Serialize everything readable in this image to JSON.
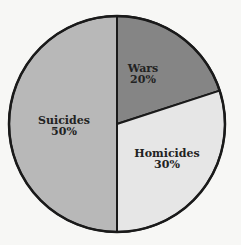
{
  "chart_data": {
    "type": "pie",
    "title": "",
    "categories": [
      "Wars",
      "Homicides",
      "Suicides"
    ],
    "values": [
      20,
      30,
      50
    ],
    "labels": [
      "Wars\n20%",
      "Homicides\n30%",
      "Suicides\n50%"
    ],
    "colors": [
      "#858585",
      "#e6e6e6",
      "#b8b8b8"
    ],
    "start_angle_deg_from_top": 0,
    "direction": "clockwise",
    "legend": "none",
    "edge_color": "#1a1a1a"
  },
  "slices": [
    {
      "name": "Wars",
      "percent": "20%",
      "value": 20,
      "color": "#858585",
      "label_pos": [
        143,
        74
      ]
    },
    {
      "name": "Homicides",
      "percent": "30%",
      "value": 30,
      "color": "#e6e6e6",
      "label_pos": [
        167,
        159
      ]
    },
    {
      "name": "Suicides",
      "percent": "50%",
      "value": 50,
      "color": "#b8b8b8",
      "label_pos": [
        64,
        126
      ]
    }
  ],
  "geometry": {
    "cx": 117,
    "cy": 124,
    "r": 108
  }
}
